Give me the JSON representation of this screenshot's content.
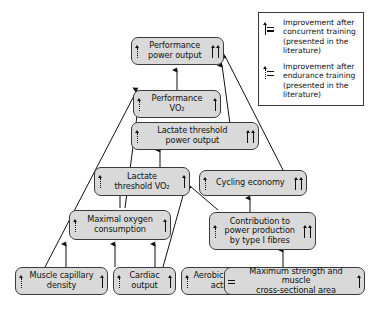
{
  "figure": {
    "type": "flow-diagram",
    "title": "",
    "background": "#ffffff",
    "node_fill": "#d9d9d9",
    "node_border": "#3a3a3a"
  },
  "legend": {
    "entries": [
      {
        "symbol": "solid-up-arrow-equals",
        "symbol_name": "concurrent-training-arrow-icon",
        "text": "Improvement after\nconcurrent training\n(presented in the\nliterature)"
      },
      {
        "symbol": "dotted-up-arrow-equals",
        "symbol_name": "endurance-training-arrow-icon",
        "text": "Improvement after\nendurance training\n(presented in the\nliterature)"
      }
    ]
  },
  "nodes": [
    {
      "id": "performance-power-output",
      "label": "Performance\npower output",
      "left_marks": [
        "dotted"
      ],
      "right_marks": [
        "solid",
        "solid"
      ]
    },
    {
      "id": "performance-vo2",
      "label": "Performance\nVO₂",
      "left_marks": [
        "dotted"
      ],
      "right_marks": [
        "solid"
      ]
    },
    {
      "id": "lactate-threshold-power-output",
      "label": "Lactate threshold\npower output",
      "left_marks": [
        "dotted"
      ],
      "right_marks": [
        "solid",
        "solid"
      ]
    },
    {
      "id": "lactate-threshold-vo2",
      "label": "Lactate\nthreshold VO₂",
      "left_marks": [
        "dotted"
      ],
      "right_marks": [
        "solid"
      ]
    },
    {
      "id": "cycling-economy",
      "label": "Cycling economy",
      "left_marks": [
        "dotted"
      ],
      "right_marks": [
        "solid",
        "solid"
      ]
    },
    {
      "id": "maximal-oxygen-consumption",
      "label": "Maximal oxygen\nconsumption",
      "left_marks": [
        "dotted"
      ],
      "right_marks": [
        "solid"
      ]
    },
    {
      "id": "contribution-type-i-fibres",
      "label": "Contribution to\npower production\nby type I fibres",
      "left_marks": [
        "dotted"
      ],
      "right_marks": [
        "solid",
        "solid"
      ]
    },
    {
      "id": "muscle-capillary-density",
      "label": "Muscle capillary\ndensity",
      "left_marks": [
        "dotted"
      ],
      "right_marks": [
        "solid"
      ]
    },
    {
      "id": "cardiac-output",
      "label": "Cardiac\noutput",
      "left_marks": [
        "dotted"
      ],
      "right_marks": [
        "solid"
      ]
    },
    {
      "id": "aerobic-enzyme-activity",
      "label": "Aerobic enzyme\nactivity",
      "left_marks": [
        "dotted"
      ],
      "right_marks": [
        "solid"
      ]
    },
    {
      "id": "maximum-strength-csa",
      "label": "Maximum strength and muscle\ncross-sectional area",
      "left_marks": [
        "equals"
      ],
      "right_marks": [
        "solid"
      ]
    }
  ],
  "edges": [
    {
      "from": "performance-vo2",
      "to": "performance-power-output"
    },
    {
      "from": "lactate-threshold-power-output",
      "to": "performance-power-output"
    },
    {
      "from": "cycling-economy",
      "to": "performance-power-output"
    },
    {
      "from": "lactate-threshold-vo2",
      "to": "lactate-threshold-power-output"
    },
    {
      "from": "maximal-oxygen-consumption",
      "to": "performance-vo2"
    },
    {
      "from": "muscle-capillary-density",
      "to": "performance-vo2"
    },
    {
      "from": "maximal-oxygen-consumption",
      "to": "lactate-threshold-vo2"
    },
    {
      "from": "aerobic-enzyme-activity",
      "to": "lactate-threshold-vo2"
    },
    {
      "from": "contribution-type-i-fibres",
      "to": "lactate-threshold-vo2"
    },
    {
      "from": "contribution-type-i-fibres",
      "to": "cycling-economy"
    },
    {
      "from": "muscle-capillary-density",
      "to": "maximal-oxygen-consumption"
    },
    {
      "from": "cardiac-output",
      "to": "maximal-oxygen-consumption"
    },
    {
      "from": "aerobic-enzyme-activity",
      "to": "maximal-oxygen-consumption"
    },
    {
      "from": "maximum-strength-csa",
      "to": "contribution-type-i-fibres"
    }
  ]
}
